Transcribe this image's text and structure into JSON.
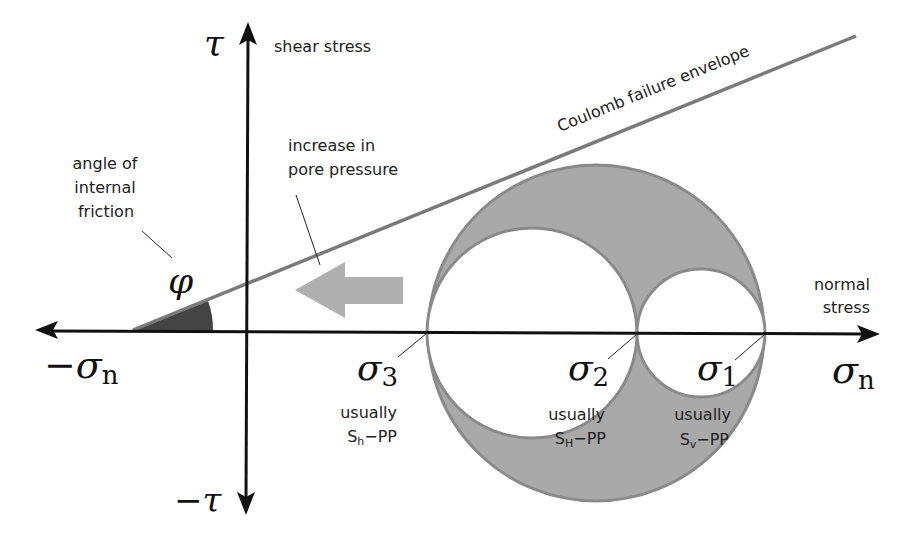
{
  "diagram": {
    "type": "Mohr circle diagram with Coulomb failure envelope",
    "axes": {
      "y_label_symbol": "τ",
      "y_label_text": "shear stress",
      "y_negative_symbol": "−τ",
      "x_label_symbol": "σ",
      "x_label_subscript": "n",
      "x_label_text_line1": "normal",
      "x_label_text_line2": "stress",
      "x_negative_symbol": "−σ",
      "x_negative_subscript": "n"
    },
    "envelope": {
      "label": "Coulomb failure envelope"
    },
    "friction_angle": {
      "symbol": "φ",
      "label_line1": "angle of",
      "label_line2": "internal",
      "label_line3": "friction"
    },
    "pore_pressure": {
      "label_line1": "increase in",
      "label_line2": "pore pressure"
    },
    "principal_stresses": [
      {
        "symbol": "σ",
        "subscript": "3",
        "note": "usually",
        "stress": "S",
        "stress_sub": "h",
        "suffix": "−PP"
      },
      {
        "symbol": "σ",
        "subscript": "2",
        "note": "usually",
        "stress": "S",
        "stress_sub": "H",
        "suffix": "−PP"
      },
      {
        "symbol": "σ",
        "subscript": "1",
        "note": "usually",
        "stress": "S",
        "stress_sub": "v",
        "suffix": "−PP"
      }
    ],
    "colors": {
      "axis": "#111111",
      "envelope": "#7a7a7a",
      "circle_fill": "#a9a9a9",
      "circle_stroke": "#8a8a8a",
      "wedge": "#444444",
      "arrow": "#b0b0b0"
    }
  }
}
